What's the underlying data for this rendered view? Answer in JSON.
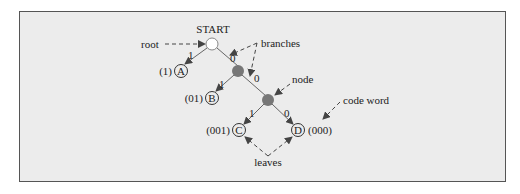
{
  "diagram": {
    "type": "binary code tree",
    "start_label": "START",
    "annotations": {
      "root": "root",
      "branches": "branches",
      "node": "node",
      "code_word": "code word",
      "leaves": "leaves"
    },
    "branch_labels": {
      "root_left": "1",
      "root_right": "0",
      "node1_left": "1",
      "node1_right": "0",
      "node2_left": "1",
      "node2_right": "0"
    },
    "leaves": [
      {
        "symbol": "A",
        "code": "(1)"
      },
      {
        "symbol": "B",
        "code": "(01)"
      },
      {
        "symbol": "C",
        "code": "(001)"
      },
      {
        "symbol": "D",
        "code": "(000)"
      }
    ],
    "colors": {
      "background": "#ececec",
      "internal_node": "#777777",
      "root_node": "#ffffff",
      "lines": "#666666"
    }
  }
}
